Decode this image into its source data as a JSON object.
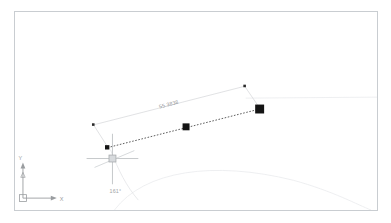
{
  "app": {
    "name": "cad-drawing-canvas",
    "background_color": "#ffffff",
    "frame_border_color": "#c9cdd1"
  },
  "annotations": {
    "dimension": {
      "label": "55.3838",
      "color": "#8e9194",
      "icon": "linear-dimension-icon"
    },
    "angle": {
      "label": "161°",
      "color": "#a0a3a6",
      "icon": "angle-arc-icon"
    }
  },
  "ucs_icon": {
    "x_label": "X",
    "y_label": "Y",
    "color": "#9a9da0"
  },
  "grips": {
    "color": "#1a1a1a",
    "items": [
      {
        "name": "grip-endpoint-right",
        "x": 246,
        "y": 98,
        "size": 9
      },
      {
        "name": "grip-midpoint",
        "x": 172,
        "y": 116,
        "size": 7
      },
      {
        "name": "grip-endpoint-left",
        "x": 93,
        "y": 136,
        "size": 5
      }
    ]
  },
  "entities": {
    "selected_line": {
      "name": "selected-line",
      "style": "dashed",
      "color": "#3a3a3a",
      "x1": 93,
      "y1": 137,
      "x2": 246,
      "y2": 98
    },
    "reference_line": {
      "name": "reference-line",
      "color": "#e6e8ea"
    },
    "arc": {
      "name": "construction-arc",
      "color": "#e4e6e8"
    }
  },
  "cursor": {
    "name": "crosshair-cursor",
    "x": 98,
    "y": 148,
    "color": "#b4b7ba",
    "pickbox_size": 7
  }
}
